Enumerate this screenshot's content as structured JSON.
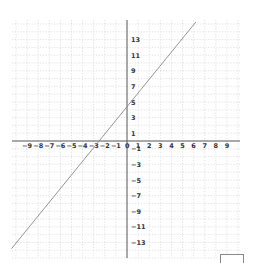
{
  "chart_data": {
    "type": "line",
    "title": "",
    "xlabel": "",
    "ylabel": "",
    "xlim": [
      -10.5,
      10
    ],
    "ylim": [
      -15,
      15
    ],
    "grid": true,
    "grid_style": "dotted",
    "x_ticks": [
      -9,
      -8,
      -7,
      -6,
      -5,
      -4,
      -3,
      -2,
      -1,
      0,
      1,
      2,
      3,
      4,
      5,
      6,
      7,
      8,
      9
    ],
    "y_ticks": [
      13,
      11,
      9,
      7,
      5,
      3,
      1,
      -1,
      -3,
      -5,
      -7,
      -9,
      -11,
      -13
    ],
    "series": [
      {
        "name": "line",
        "equation": "y = 1.75x + 4.4",
        "slope": 1.75,
        "intercept": 4.4,
        "x": [
          -10.4,
          6.2
        ],
        "y": [
          -13.8,
          15.25
        ]
      }
    ],
    "colors": {
      "line": "#888888",
      "axis": "#555555",
      "grid": "#cccccc",
      "label": "#333333"
    }
  },
  "footer": {
    "box_label": ""
  }
}
